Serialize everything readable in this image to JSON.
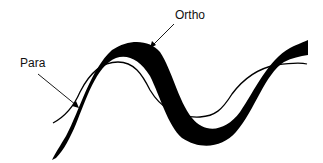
{
  "diagram": {
    "labels": {
      "ortho": "Ortho",
      "para": "Para"
    },
    "colors": {
      "band": "#000000",
      "line": "#000000",
      "background": "#ffffff",
      "text": "#111111"
    }
  }
}
